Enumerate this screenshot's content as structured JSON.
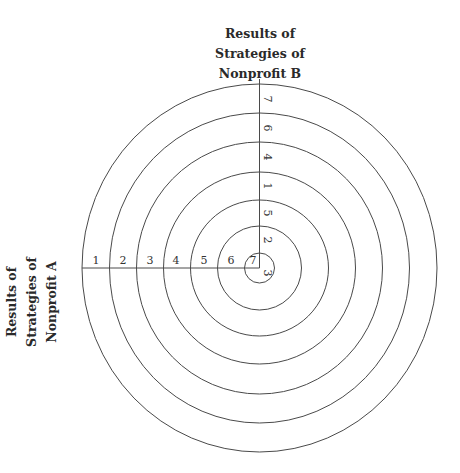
{
  "title_top": {
    "lines": [
      "Results of",
      "Strategies of",
      "Nonprofit B"
    ]
  },
  "title_left": {
    "lines": [
      "Results of",
      "Strategies of",
      "Nonprofit A"
    ]
  },
  "rings": {
    "count": 7,
    "stroke_color": "#444444"
  },
  "horizontal_axis": {
    "label": "Nonprofit A",
    "values": [
      "1",
      "2",
      "3",
      "4",
      "5",
      "6",
      "7"
    ]
  },
  "vertical_axis": {
    "label": "Nonprofit B",
    "values": [
      "7",
      "6",
      "4",
      "1",
      "5",
      "2",
      "3"
    ]
  }
}
